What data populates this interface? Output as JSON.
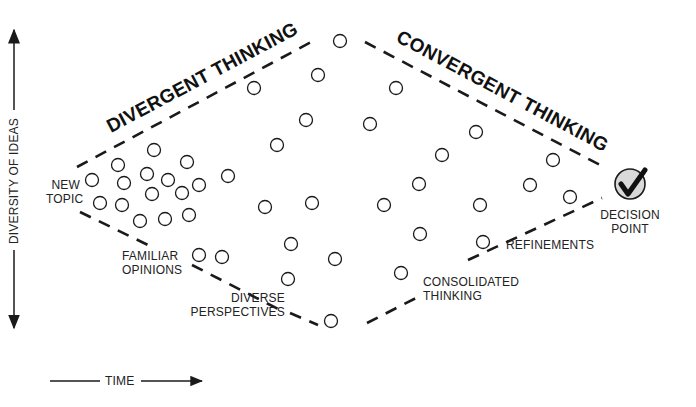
{
  "titles": {
    "divergent": "DIVERGENT THINKING",
    "convergent": "CONVERGENT THINKING"
  },
  "axes": {
    "y_label": "DIVERSITY OF IDEAS",
    "x_label": "TIME"
  },
  "labels": {
    "new_topic_1": "NEW",
    "new_topic_2": "TOPIC",
    "familiar_1": "FAMILIAR",
    "familiar_2": "OPINIONS",
    "diverse_1": "DIVERSE",
    "diverse_2": "PERSPECTIVES",
    "consolidated_1": "CONSOLIDATED",
    "consolidated_2": "THINKING",
    "refinements": "REFINEMENTS",
    "decision_1": "DECISION",
    "decision_2": "POINT"
  },
  "decision_icon": "checkmark-icon",
  "colors": {
    "line": "#1a1a1a",
    "decision_fill": "#d9d9d9"
  },
  "idea_circles": [
    [
      92,
      180
    ],
    [
      118,
      165
    ],
    [
      154,
      150
    ],
    [
      187,
      162
    ],
    [
      124,
      183
    ],
    [
      147,
      174
    ],
    [
      168,
      180
    ],
    [
      199,
      185
    ],
    [
      228,
      176
    ],
    [
      100,
      203
    ],
    [
      122,
      205
    ],
    [
      152,
      194
    ],
    [
      182,
      193
    ],
    [
      140,
      221
    ],
    [
      165,
      219
    ],
    [
      189,
      215
    ],
    [
      199,
      255
    ],
    [
      222,
      257
    ],
    [
      254,
      88
    ],
    [
      318,
      75
    ],
    [
      340,
      41
    ],
    [
      277,
      145
    ],
    [
      306,
      120
    ],
    [
      265,
      207
    ],
    [
      312,
      203
    ],
    [
      291,
      244
    ],
    [
      335,
      259
    ],
    [
      288,
      279
    ],
    [
      331,
      321
    ],
    [
      396,
      88
    ],
    [
      370,
      124
    ],
    [
      384,
      205
    ],
    [
      420,
      234
    ],
    [
      401,
      273
    ],
    [
      419,
      184
    ],
    [
      442,
      155
    ],
    [
      476,
      132
    ],
    [
      480,
      205
    ],
    [
      483,
      242
    ],
    [
      530,
      185
    ],
    [
      553,
      160
    ],
    [
      570,
      197
    ]
  ]
}
